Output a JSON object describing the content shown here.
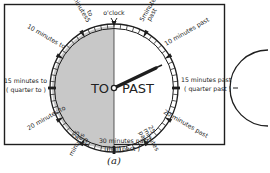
{
  "figure": {
    "caption": "(a)",
    "colors": {
      "to_half": "#c8c8c8",
      "past_half": "#ffffff",
      "ink": "#1e1e1e"
    },
    "dial": {
      "top_label": "o'clock",
      "left_half": "TO",
      "right_half": "PAST"
    },
    "labels": {
      "min5_past_a": "5",
      "min5_past_b": "minutes",
      "min5_past_c": "past",
      "min10_past": "10 minutes past",
      "min15_past_a": "15 minutes past",
      "min15_past_b": "( quarter past )",
      "min20_past": "20 minutes past",
      "min25_past_a": "25",
      "min25_past_b": "minutes",
      "min25_past_c": "past",
      "min30_a": "30 minutes past",
      "min30_b": "( half past )",
      "min25_to_a": "25",
      "min25_to_b": "minutes",
      "min25_to_c": "to",
      "min20_to": "20 minutes to",
      "min15_to_a": "15 minutes to",
      "min15_to_b": "( quarter to )",
      "min10_to": "10 minutes to",
      "min5_to_a": "5",
      "min5_to_b": "minutes",
      "min5_to_c": "to"
    }
  }
}
